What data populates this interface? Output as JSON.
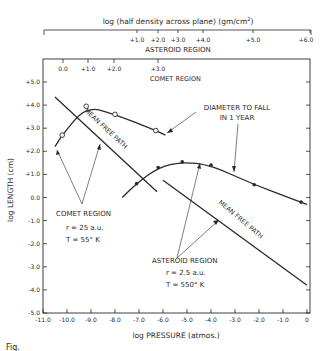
{
  "chart_data": {
    "type": "line",
    "title": "",
    "xlabel": "log PRESSURE (atmos.)",
    "ylabel": "log LENGTH (cm)",
    "xlim": [
      -11.0,
      0.0
    ],
    "ylim": [
      -5.0,
      5.5
    ],
    "x_ticks": [
      "-11.0",
      "-10.0",
      "-9.0",
      "-8.0",
      "-7.0",
      "-6.0",
      "-5.0",
      "-4.0",
      "-3.0",
      "-2.0",
      "-1.0",
      "0"
    ],
    "y_ticks": [
      "+5.0",
      "+4.0",
      "+3.0",
      "+2.0",
      "+1.0",
      "0.0",
      "-1.0",
      "-2.0",
      "-3.0",
      "-4.0",
      "-5.0"
    ],
    "top_axis": {
      "label": "log (half density across plane) (gm/cm²)",
      "region_label": "ASTEROID REGION",
      "ticks": [
        "+1.0",
        "+2.0",
        "+3.0",
        "+4.0",
        "+5.0",
        "+6.0"
      ]
    },
    "inner_top_axis": {
      "region_label": "COMET REGION",
      "ticks": [
        "0.0",
        "+1.0",
        "+2.0",
        "+3.0"
      ]
    },
    "grid": false,
    "series": [
      {
        "name": "Diameter to fall in 1 year (comet region)",
        "marker": "open-circle",
        "x": [
          -10.5,
          -10.2,
          -9.2,
          -8.0,
          -6.3,
          -5.9
        ],
        "y": [
          2.2,
          2.7,
          3.95,
          3.6,
          2.9,
          2.7
        ]
      },
      {
        "name": "Mean free path (comet region)",
        "marker": "none",
        "x": [
          -10.5,
          -6.25
        ],
        "y": [
          4.35,
          0.25
        ]
      },
      {
        "name": "Diameter to fall in 1 year (asteroid region)",
        "marker": "filled-circle",
        "x": [
          -7.7,
          -7.1,
          -6.2,
          -5.2,
          -4.0,
          -2.2,
          -0.25,
          0.0
        ],
        "y": [
          0.0,
          0.6,
          1.3,
          1.55,
          1.4,
          0.55,
          -0.2,
          -0.3
        ]
      },
      {
        "name": "Mean free path (asteroid region)",
        "marker": "none",
        "x": [
          -6.0,
          0.0
        ],
        "y": [
          0.75,
          -3.8
        ]
      }
    ],
    "annotations": [
      "DIAMETER TO FALL IN 1 YEAR",
      "MEAN FREE PATH",
      "MEAN FREE PATH",
      "COMET REGION",
      "r = 25 a.u.",
      "T = 55° K",
      "ASTEROID REGION",
      "r = 2.5 a.u.",
      "T = 550° K"
    ]
  },
  "labels": {
    "top_axis_title": "log (half density across plane) (gm/cm",
    "top_axis_sup": "2",
    "top_axis_close": ")",
    "top_region": "ASTEROID REGION",
    "comet_axis_region": "COMET REGION",
    "diameter_line1": "DIAMETER TO FALL",
    "diameter_line2": "IN 1 YEAR",
    "mfp": "MEAN FREE PATH",
    "comet_region": "COMET REGION",
    "comet_r": "r = 25  a.u.",
    "comet_T": "T = 55° K",
    "asteroid_region": "ASTEROID REGION",
    "asteroid_r": "r = 2.5  a.u.",
    "asteroid_T": "T = 550° K",
    "xlabel": "log  PRESSURE (atmos.)",
    "ylabel": "log LENGTH (cm)",
    "fig": "Fig."
  },
  "colors": {
    "ink": "#2a2a2a",
    "background": "#ffffff"
  }
}
